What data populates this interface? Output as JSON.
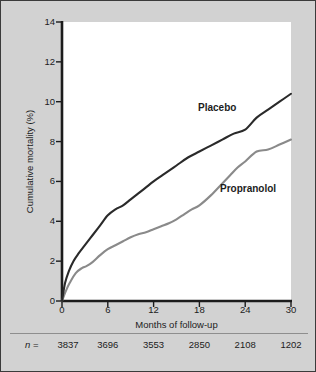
{
  "figure": {
    "background_color": "#d2d2d2",
    "plot_background_color": "#ffffff",
    "border_color": "#3b3b3b"
  },
  "axes": {
    "y_title": "Cumulative mortality (%)",
    "x_title": "Months of follow-up",
    "y_ticks": [
      "0",
      "2",
      "4",
      "6",
      "8",
      "10",
      "12",
      "14"
    ],
    "x_ticks": [
      "0",
      "6",
      "12",
      "18",
      "24",
      "30"
    ]
  },
  "series_labels": {
    "placebo": "Placebo",
    "propranolol": "Propranolol"
  },
  "n_row": {
    "prefix_italic": "n",
    "prefix_rest": " = ",
    "values": [
      "3837",
      "3696",
      "3553",
      "2850",
      "2108",
      "1202"
    ]
  },
  "chart_data": {
    "type": "line",
    "title": "",
    "subtitle": "",
    "xlabel": "Months of follow-up",
    "ylabel": "Cumulative mortality (%)",
    "xlim": [
      0,
      30
    ],
    "ylim": [
      0,
      14
    ],
    "xticks": [
      0,
      6,
      12,
      18,
      24,
      30
    ],
    "yticks": [
      0,
      2,
      4,
      6,
      8,
      10,
      12,
      14
    ],
    "grid": false,
    "legend": "inline-annotations",
    "annotations": [
      {
        "text": "Placebo",
        "x": 20.5,
        "y": 9.9
      },
      {
        "text": "Propranolol",
        "x": 23.5,
        "y": 5.8
      }
    ],
    "axis_n_labels": {
      "label": "n =",
      "x": [
        0,
        6,
        12,
        18,
        24,
        30
      ],
      "values": [
        3837,
        3696,
        3553,
        2850,
        2108,
        1202
      ]
    },
    "series": [
      {
        "name": "Placebo",
        "color": "#2a2a2a",
        "line_width": 2.1,
        "x": [
          0,
          0.4,
          0.9,
          1.5,
          2.2,
          3.0,
          4.0,
          5.0,
          6.0,
          7.0,
          8.0,
          9.0,
          10.0,
          11.0,
          12.0,
          13.5,
          15.0,
          16.5,
          18.0,
          19.5,
          21.0,
          22.5,
          24.0,
          25.5,
          27.0,
          28.5,
          30.0
        ],
        "y": [
          0.0,
          0.9,
          1.5,
          2.0,
          2.4,
          2.8,
          3.3,
          3.8,
          4.3,
          4.6,
          4.8,
          5.1,
          5.4,
          5.7,
          6.0,
          6.4,
          6.8,
          7.2,
          7.5,
          7.8,
          8.1,
          8.4,
          8.6,
          9.2,
          9.6,
          10.0,
          10.4
        ]
      },
      {
        "name": "Propranolol",
        "color": "#8a8a8a",
        "line_width": 2.1,
        "x": [
          0,
          0.5,
          1.0,
          1.8,
          2.6,
          3.2,
          4.0,
          5.0,
          6.0,
          7.0,
          8.0,
          9.0,
          10.0,
          11.0,
          12.0,
          13.0,
          14.0,
          15.0,
          16.0,
          17.0,
          18.0,
          19.5,
          21.0,
          22.0,
          23.0,
          24.0,
          25.5,
          27.0,
          28.5,
          30.0
        ],
        "y": [
          0.0,
          0.5,
          0.9,
          1.4,
          1.65,
          1.75,
          1.95,
          2.3,
          2.6,
          2.8,
          3.0,
          3.2,
          3.35,
          3.45,
          3.6,
          3.75,
          3.9,
          4.1,
          4.35,
          4.6,
          4.8,
          5.3,
          5.9,
          6.3,
          6.7,
          7.0,
          7.5,
          7.6,
          7.85,
          8.1
        ]
      }
    ]
  }
}
